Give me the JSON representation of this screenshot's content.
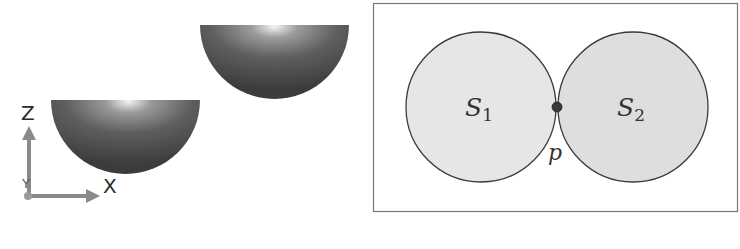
{
  "left_panel": {
    "description": "Two hemispherical bowls offset in 3D view with coordinate axes",
    "axes": {
      "z_label": "Z",
      "x_label": "X",
      "y_label": "Y",
      "color": "#8a8a8a"
    },
    "bowls": [
      {
        "name": "lower-left-bowl",
        "color": "#4a4a4a"
      },
      {
        "name": "upper-right-bowl",
        "color": "#4a4a4a"
      }
    ]
  },
  "right_panel": {
    "description": "Two tangent circles touching at a single point",
    "border_color": "#777777",
    "circles": [
      {
        "label": "S",
        "subscript": "1",
        "fill": "#e6e6e6"
      },
      {
        "label": "S",
        "subscript": "2",
        "fill": "#dedede"
      }
    ],
    "contact_point": {
      "label": "p",
      "color": "#3a3a3a"
    }
  }
}
